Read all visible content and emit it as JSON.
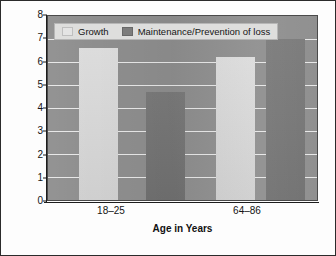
{
  "chart_data": {
    "type": "bar",
    "title": "",
    "subtitle": "",
    "xlabel": "Age in Years",
    "ylabel": "Mean Rating Across Personal Goals",
    "categories": [
      "18–25",
      "64–86"
    ],
    "series": [
      {
        "name": "Growth",
        "values": [
          6.6,
          6.2
        ],
        "color": "#d5d5d5"
      },
      {
        "name": "Maintenance/Prevention of loss",
        "values": [
          4.7,
          7.0
        ],
        "color": "#757575"
      }
    ],
    "ylim": [
      0,
      8
    ],
    "yticks": [
      0,
      1,
      2,
      3,
      4,
      5,
      6,
      7,
      8
    ],
    "ytick_labels": [
      "0",
      "1",
      "2",
      "3",
      "4",
      "5",
      "6",
      "7",
      "8"
    ],
    "grid": true,
    "grid_axis": "y",
    "grid_color": "#efefef",
    "legend_position": "upper-left-inside",
    "plot_background": "#8e8e8e",
    "figure_background": "#fdfdfd",
    "border_color": "#2b2b2b",
    "bars": [
      {
        "group": "18–25",
        "series": "Growth",
        "value": 6.6
      },
      {
        "group": "18–25",
        "series": "Maintenance/Prevention of loss",
        "value": 4.7
      },
      {
        "group": "64–86",
        "series": "Growth",
        "value": 6.2
      },
      {
        "group": "64–86",
        "series": "Maintenance/Prevention of loss",
        "value": 7.0
      }
    ]
  },
  "legend": {
    "entries": [
      {
        "label": "Growth"
      },
      {
        "label": "Maintenance/Prevention of loss"
      }
    ]
  }
}
